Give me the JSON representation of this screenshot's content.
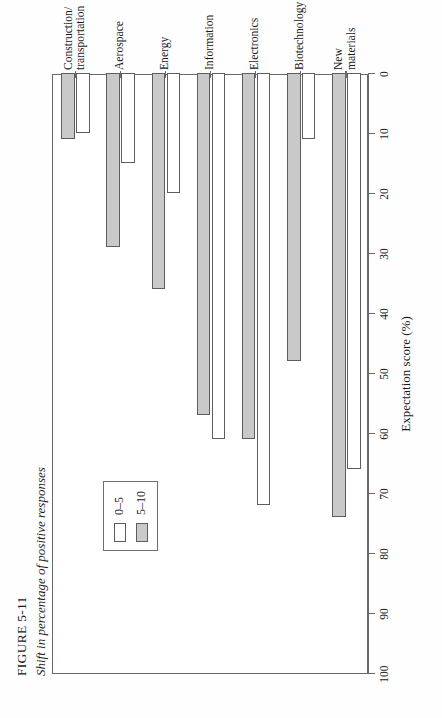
{
  "figure": {
    "number": "FIGURE 5-11",
    "caption": "Shift in percentage of positive responses"
  },
  "legend": {
    "position": "top-left-inside-plot",
    "entries": [
      {
        "label": "0–5",
        "swatch": "open-white-box",
        "color": "#ffffff"
      },
      {
        "label": "5–10",
        "swatch": "filled-grey-box",
        "color": "#c9c9c9"
      }
    ]
  },
  "axis": {
    "value_title": "Expectation score (%)",
    "ticks": [
      "100",
      "90",
      "80",
      "70",
      "60",
      "50",
      "40",
      "30",
      "20",
      "10",
      "0"
    ],
    "tick_values": [
      100,
      90,
      80,
      70,
      60,
      50,
      40,
      30,
      20,
      10,
      0
    ],
    "min": 0,
    "max": 100,
    "reversed": true
  },
  "colors": {
    "series_low_fill": "#ffffff",
    "series_high_fill": "#c9c9c9",
    "line": "#5d5d5d",
    "frame": "#6a6a6a",
    "text": "#1a1a1a",
    "background": "#ffffff"
  },
  "chart_data": {
    "type": "bar",
    "orientation": "horizontal",
    "title": "FIGURE 5-11",
    "subtitle": "Shift in percentage of positive responses",
    "xlabel": "Expectation score (%)",
    "ylabel": "",
    "xlim": [
      0,
      100
    ],
    "x_reversed": true,
    "grid": false,
    "legend_position": "upper left (inside axes)",
    "categories": [
      "New materials",
      "Biotechnology",
      "Electronics",
      "Information",
      "Energy",
      "Aerospace",
      "Construction/\ntransportation"
    ],
    "series": [
      {
        "name": "0–5",
        "values": [
          66,
          11,
          72,
          61,
          20,
          15,
          10
        ]
      },
      {
        "name": "5–10",
        "values": [
          74,
          48,
          61,
          57,
          36,
          29,
          11
        ]
      }
    ],
    "annotations": []
  }
}
